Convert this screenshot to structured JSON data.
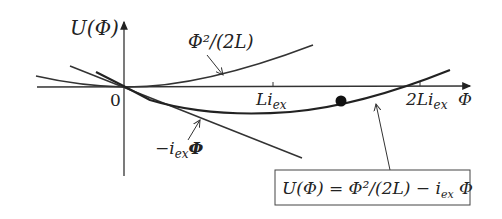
{
  "diagram": {
    "y_axis_label": "U(Φ)",
    "x_axis_label": "Φ",
    "origin_label": "0",
    "ticks": [
      {
        "label_main": "Li",
        "label_sub": "ex"
      },
      {
        "label_main": "2Li",
        "label_sub": "ex"
      }
    ],
    "curves": [
      {
        "name": "quadratic",
        "label": "Φ²/(2L)"
      },
      {
        "name": "linear",
        "label": "−i",
        "label_sub": "ex",
        "label_tail": "Φ"
      },
      {
        "name": "total",
        "label": "U(Φ) = Φ²/(2L) − i_ex Φ"
      }
    ],
    "equation_box": {
      "lhs": "U(Φ)",
      "eq": " = Φ²/(2L) − i",
      "sub": "ex",
      "tail": " Φ"
    },
    "marker": "ball"
  }
}
